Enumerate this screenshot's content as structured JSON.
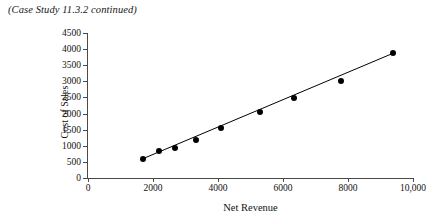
{
  "caption": "(Case Study 11.3.2 continued)",
  "chart_data": {
    "type": "scatter",
    "title": "",
    "xlabel": "Net Revenue",
    "ylabel": "Cost of Sales",
    "xlim": [
      0,
      10000
    ],
    "ylim": [
      0,
      4500
    ],
    "grid": false,
    "legend": null,
    "xticks": [
      0,
      2000,
      4000,
      6000,
      8000,
      10000
    ],
    "xtick_labels": [
      "0",
      "2000",
      "4000",
      "6000",
      "8000",
      "10,000"
    ],
    "yticks": [
      0,
      500,
      1000,
      1500,
      2000,
      2500,
      3000,
      3500,
      4000,
      4500
    ],
    "ytick_labels": [
      "0",
      "500",
      "1000",
      "1500",
      "2000",
      "2500",
      "3000",
      "3500",
      "4000",
      "4500"
    ],
    "x": [
      1692,
      2185,
      2677,
      3323,
      4092,
      5292,
      6338,
      7785,
      9385
    ],
    "y": [
      590,
      838,
      931,
      1179,
      1552,
      2048,
      2483,
      3010,
      3879
    ],
    "series": [
      {
        "name": "observations",
        "marker": "filled-circle",
        "color": "#000000",
        "points": [
          {
            "x": 1692,
            "y": 590
          },
          {
            "x": 2185,
            "y": 838
          },
          {
            "x": 2677,
            "y": 931
          },
          {
            "x": 3323,
            "y": 1179
          },
          {
            "x": 4092,
            "y": 1552
          },
          {
            "x": 5292,
            "y": 2048
          },
          {
            "x": 6338,
            "y": 2483
          },
          {
            "x": 7785,
            "y": 3010
          },
          {
            "x": 9385,
            "y": 3879
          }
        ]
      },
      {
        "name": "regression-line",
        "type": "line",
        "color": "#000000",
        "endpoints": [
          {
            "x": 1692,
            "y": 600
          },
          {
            "x": 9385,
            "y": 3870
          }
        ]
      }
    ]
  }
}
